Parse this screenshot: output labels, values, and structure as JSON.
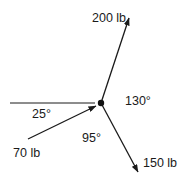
{
  "diagram": {
    "type": "force-vector-diagram",
    "center": {
      "x": 101,
      "y": 103
    },
    "colors": {
      "stroke": "#1a1a1a",
      "background": "#ffffff"
    },
    "reference_line": {
      "x1": 10,
      "y1": 103,
      "x2": 95,
      "y2": 103
    },
    "forces": [
      {
        "id": "f200",
        "label": "200 lb",
        "from": {
          "x": 101,
          "y": 103
        },
        "to": {
          "x": 129,
          "y": 18
        },
        "label_pos": {
          "x": 92,
          "y": 22
        }
      },
      {
        "id": "f150",
        "label": "150 lb",
        "from": {
          "x": 101,
          "y": 103
        },
        "to": {
          "x": 138,
          "y": 172
        },
        "label_pos": {
          "x": 143,
          "y": 167
        }
      },
      {
        "id": "f70",
        "label": "70 lb",
        "from": {
          "x": 28,
          "y": 139
        },
        "to": {
          "x": 97,
          "y": 106
        },
        "label_pos": {
          "x": 13,
          "y": 157
        }
      }
    ],
    "angles": [
      {
        "id": "a130",
        "label": "130°",
        "pos": {
          "x": 125,
          "y": 105
        }
      },
      {
        "id": "a25",
        "label": "25°",
        "pos": {
          "x": 32,
          "y": 118
        }
      },
      {
        "id": "a95",
        "label": "95°",
        "pos": {
          "x": 82,
          "y": 142
        }
      }
    ]
  }
}
